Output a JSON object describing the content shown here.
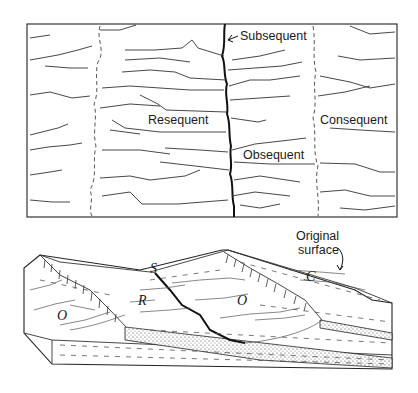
{
  "plan_view": {
    "labels": {
      "subsequent": "Subsequent",
      "resequent": "Resequent",
      "obsequent": "Obsequent",
      "consequent": "Consequent"
    }
  },
  "block_diagram": {
    "labels": {
      "s": "S",
      "r": "R",
      "o_left": "O",
      "o_right": "O",
      "c": "C",
      "original_surface_line1": "Original",
      "original_surface_line2": "surface"
    }
  },
  "colors": {
    "ink": "#1a1a1a",
    "background": "#ffffff"
  }
}
